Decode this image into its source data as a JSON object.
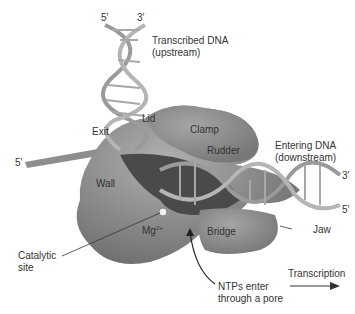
{
  "diagram": {
    "labels": {
      "top_5prime": "5′",
      "top_3prime": "3′",
      "transcribed_dna_line1": "Transcribed DNA",
      "transcribed_dna_line2": "(upstream)",
      "lid": "Lid",
      "exit": "Exit",
      "clamp": "Clamp",
      "rudder": "Rudder",
      "entering_dna_line1": "Entering DNA",
      "entering_dna_line2": "(downstream)",
      "right_3prime": "3′",
      "right_5prime": "5′",
      "left_5prime": "5′",
      "wall": "Wall",
      "mg": "Mg",
      "mg_sup": "2+",
      "bridge": "Bridge",
      "jaw": "Jaw",
      "catalytic_line1": "Catalytic",
      "catalytic_line2": "site",
      "ntps_line1": "NTPs enter",
      "ntps_line2": "through a pore",
      "transcription": "Transcription"
    },
    "colors": {
      "protein": "#8a8a8a",
      "protein_dark": "#5a5a5a",
      "dna": "#9a9a9a",
      "text": "#333333"
    }
  }
}
